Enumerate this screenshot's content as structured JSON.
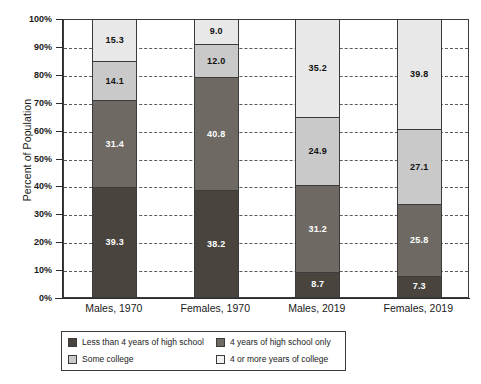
{
  "chart_data": {
    "type": "bar",
    "subtype": "stacked-bar-100",
    "title": "",
    "xlabel": "",
    "ylabel": "Percent of Population",
    "ylim": [
      0,
      100
    ],
    "ytick_step": 10,
    "ytick_labels": [
      "0%",
      "10%",
      "20%",
      "30%",
      "40%",
      "50%",
      "60%",
      "70%",
      "80%",
      "90%",
      "100%"
    ],
    "grid": "horizontal-dashed",
    "legend_position": "bottom",
    "categories": [
      "Males, 1970",
      "Females, 1970",
      "Males, 2019",
      "Females, 2019"
    ],
    "series": [
      {
        "name": "Less than 4 years of high school",
        "color": "#4a443e",
        "values": [
          39.3,
          38.2,
          8.7,
          7.3
        ],
        "labels": [
          "39.3",
          "38.2",
          "8.7",
          "7.3"
        ]
      },
      {
        "name": "4 years of high school only",
        "color": "#6e6a63",
        "values": [
          31.4,
          40.8,
          31.2,
          25.8
        ],
        "labels": [
          "31.4",
          "40.8",
          "31.2",
          "25.8"
        ]
      },
      {
        "name": "Some college",
        "color": "#c9c9c9",
        "values": [
          14.1,
          12.0,
          24.9,
          27.1
        ],
        "labels": [
          "14.1",
          "12.0",
          "24.9",
          "27.1"
        ]
      },
      {
        "name": "4 or more years of college",
        "color": "#e8e8e8",
        "values": [
          15.3,
          9.0,
          35.2,
          39.8
        ],
        "labels": [
          "15.3",
          "9.0",
          "35.2",
          "39.8"
        ]
      }
    ]
  },
  "legend": {
    "entries": [
      {
        "label": "Less than 4 years of high school",
        "swatch": "s0"
      },
      {
        "label": "4 years of high school only",
        "swatch": "s1"
      },
      {
        "label": "Some college",
        "swatch": "s2"
      },
      {
        "label": "4 or more years of college",
        "swatch": "s3"
      }
    ]
  }
}
